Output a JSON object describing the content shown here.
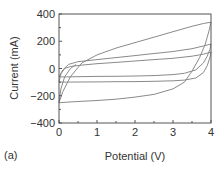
{
  "panel_label": "(a)",
  "chart_data": {
    "type": "line",
    "title": "",
    "xlabel": "Potential (V)",
    "ylabel": "Current (mA)",
    "xlim": [
      0,
      4
    ],
    "ylim": [
      -400,
      400
    ],
    "xticks": [
      0,
      1,
      2,
      3,
      4
    ],
    "yticks": [
      -400,
      -200,
      0,
      200,
      400
    ],
    "grid": false,
    "legend": null,
    "line_color": "#8a8a8a",
    "axis_color": "#555555",
    "series": [
      {
        "name": "loop-large",
        "x": [
          0.0,
          0.1,
          0.3,
          0.6,
          1.0,
          1.5,
          2.0,
          2.5,
          3.0,
          3.5,
          3.8,
          4.0,
          3.95,
          3.85,
          3.7,
          3.5,
          3.3,
          3.0,
          2.5,
          2.0,
          1.5,
          1.0,
          0.5,
          0.2,
          0.05,
          0.0,
          0.05,
          0.15,
          0.3,
          0.45
        ],
        "y": [
          -250,
          -170,
          -60,
          40,
          100,
          150,
          190,
          230,
          270,
          310,
          330,
          340,
          280,
          180,
          80,
          -20,
          -100,
          -150,
          -190,
          -210,
          -225,
          -235,
          -242,
          -247,
          -250,
          -252,
          -150,
          -60,
          0,
          30
        ]
      },
      {
        "name": "loop-medium",
        "x": [
          0.0,
          0.1,
          0.25,
          0.5,
          1.0,
          1.5,
          2.0,
          2.5,
          3.0,
          3.5,
          3.8,
          4.0,
          3.97,
          3.9,
          3.8,
          3.6,
          3.3,
          3.0,
          2.5,
          2.0,
          1.5,
          1.0,
          0.5,
          0.2,
          0.05,
          0.0
        ],
        "y": [
          -60,
          -10,
          30,
          50,
          65,
          80,
          95,
          110,
          125,
          145,
          165,
          180,
          140,
          90,
          40,
          -10,
          -35,
          -45,
          -52,
          -55,
          -57,
          -58,
          -60,
          -62,
          -62,
          -60
        ]
      },
      {
        "name": "loop-small",
        "x": [
          0.0,
          0.05,
          0.15,
          0.3,
          0.6,
          1.0,
          1.5,
          2.0,
          2.5,
          3.0,
          3.5,
          3.8,
          4.0,
          3.97,
          3.9,
          3.8,
          3.6,
          3.3,
          3.0,
          2.5,
          2.0,
          1.5,
          1.0,
          0.5,
          0.2,
          0.05,
          0.0
        ],
        "y": [
          -100,
          -40,
          0,
          15,
          25,
          35,
          45,
          55,
          65,
          75,
          90,
          105,
          120,
          80,
          20,
          -30,
          -70,
          -85,
          -90,
          -94,
          -96,
          -97,
          -98,
          -99,
          -100,
          -100,
          -100
        ]
      }
    ]
  }
}
